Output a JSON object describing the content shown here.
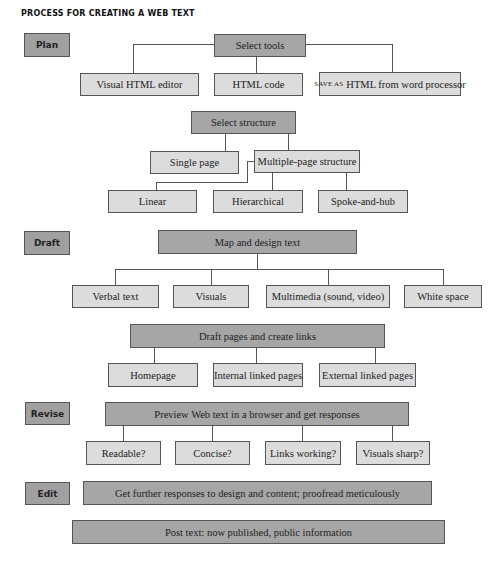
{
  "title": "PROCESS FOR CREATING A WEB TEXT",
  "stages": {
    "plan": "Plan",
    "draft": "Draft",
    "revise": "Revise",
    "edit": "Edit"
  },
  "plan": {
    "select_tools": "Select tools",
    "tools": {
      "visual_editor": "Visual HTML editor",
      "html_code": "HTML code",
      "save_as_prefix": "SAVE AS",
      "save_as_rest": "HTML from word processor"
    },
    "select_structure": "Select structure",
    "structure": {
      "single": "Single page",
      "multiple": "Multiple-page structure",
      "linear": "Linear",
      "hierarchical": "Hierarchical",
      "spoke": "Spoke-and-hub"
    }
  },
  "draft": {
    "map_design": "Map and design text",
    "elements": {
      "verbal": "Verbal text",
      "visuals": "Visuals",
      "multimedia": "Multimedia (sound, video)",
      "white_space": "White space"
    },
    "draft_pages": "Draft pages and create links",
    "pages": {
      "homepage": "Homepage",
      "internal": "Internal linked pages",
      "external": "External linked pages"
    }
  },
  "revise": {
    "preview": "Preview Web text in a browser and get responses",
    "checks": {
      "readable": "Readable?",
      "concise": "Concise?",
      "links": "Links working?",
      "visuals": "Visuals sharp?"
    }
  },
  "edit": {
    "further": "Get further responses to design and content; proofread meticulously"
  },
  "post": "Post text: now published, public information"
}
